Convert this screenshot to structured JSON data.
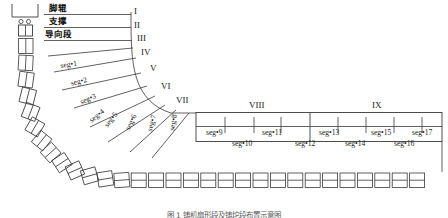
{
  "diagram": {
    "machine_labels": {
      "foot_roll": "脚辊",
      "support": "支撑",
      "guide_section": "导向段"
    },
    "roman_numerals": [
      {
        "id": "I",
        "label": "I"
      },
      {
        "id": "II",
        "label": "II"
      },
      {
        "id": "III",
        "label": "III"
      },
      {
        "id": "IV",
        "label": "IV"
      },
      {
        "id": "V",
        "label": "V"
      },
      {
        "id": "VI",
        "label": "VI"
      },
      {
        "id": "VII",
        "label": "VII"
      },
      {
        "id": "VIII",
        "label": "VIII"
      },
      {
        "id": "IX",
        "label": "IX"
      }
    ],
    "curve_segments": [
      {
        "label": "seg•1"
      },
      {
        "label": "seg•2"
      },
      {
        "label": "seg•3"
      },
      {
        "label": "seg•4"
      },
      {
        "label": "seg•5"
      },
      {
        "label": "seg•6"
      },
      {
        "label": "seg•7"
      },
      {
        "label": "seg•8"
      }
    ],
    "straight_segments_top": [
      {
        "label": "seg•9"
      },
      {
        "label": "seg•11"
      },
      {
        "label": "seg•13"
      },
      {
        "label": "seg•15"
      },
      {
        "label": "seg•17"
      }
    ],
    "straight_segments_bottom": [
      {
        "label": "seg•10"
      },
      {
        "label": "seg•12"
      },
      {
        "label": "seg•14"
      },
      {
        "label": "seg•16"
      }
    ],
    "zone_labels": [
      {
        "label": "VIII"
      },
      {
        "label": "IX"
      }
    ],
    "colors": {
      "line": "#3a3a3a",
      "strand": "#333333",
      "text": "#1a1a1a",
      "caption": "#5a5a5a",
      "background": "#ffffff"
    }
  },
  "caption": {
    "figure_no": "图 1",
    "text": "铸机扇形段及铸坨段布置示意图"
  }
}
